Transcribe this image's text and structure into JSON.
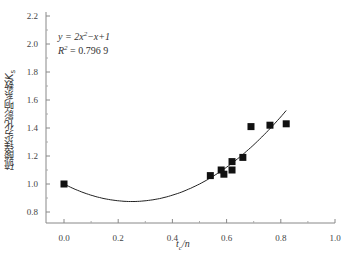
{
  "chart_data": {
    "type": "scatter",
    "title": "",
    "xlabel": "t_c/n",
    "ylabel": "硫酸镁劣化影响系数K_s",
    "xlim": [
      0.0,
      1.0
    ],
    "ylim": [
      0.8,
      2.2
    ],
    "x_ticks": [
      "0.0",
      "0.2",
      "0.4",
      "0.6",
      "0.8",
      "1.0"
    ],
    "y_ticks": [
      "0.8",
      "1.0",
      "1.2",
      "1.4",
      "1.6",
      "1.8",
      "2.0",
      "2.2"
    ],
    "grid": false,
    "legend": null,
    "series": [
      {
        "name": "measured",
        "marker": "square",
        "x": [
          0.0,
          0.54,
          0.58,
          0.59,
          0.62,
          0.62,
          0.66,
          0.69,
          0.76,
          0.82
        ],
        "y": [
          1.0,
          1.06,
          1.1,
          1.07,
          1.16,
          1.1,
          1.19,
          1.41,
          1.42,
          1.43
        ]
      },
      {
        "name": "fit",
        "type": "line",
        "equation": "y = 2x^2 - x + 1",
        "x_range": [
          0.0,
          0.82
        ]
      }
    ],
    "annotations": [
      "y = 2x²−x+1",
      "R² = 0.796 9"
    ]
  },
  "labels": {
    "eq_line1": "y = 2x",
    "eq_line1_sup": "2",
    "eq_line1_rest": "−x+1",
    "eq_line2": "R",
    "eq_line2_sup": "2",
    "eq_line2_rest": " = 0.796 9",
    "ylabel_main": "硫酸镁劣化影响系数",
    "ylabel_var": "K",
    "ylabel_sub": "s",
    "xlabel_var": "t",
    "xlabel_sub": "c",
    "xlabel_rest": "/n"
  }
}
